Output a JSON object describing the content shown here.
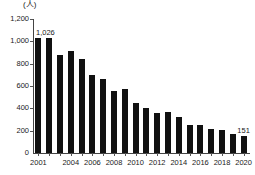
{
  "chart_data": {
    "type": "bar",
    "title": "",
    "subtitle": "",
    "unit_label": "(人)",
    "xlabel": "",
    "ylabel": "",
    "ylim": [
      0,
      1200
    ],
    "ytick_values": [
      0,
      200,
      400,
      600,
      800,
      1000,
      1200
    ],
    "ytick_labels": [
      "0",
      "200",
      "400",
      "600",
      "800",
      "1,000",
      "1,200"
    ],
    "grid": false,
    "legend": "none",
    "bar_color": "#111111",
    "categories": [
      "2001",
      "2002",
      "2003",
      "2004",
      "2005",
      "2006",
      "2007",
      "2008",
      "2009",
      "2010",
      "2011",
      "2012",
      "2013",
      "2014",
      "2015",
      "2016",
      "2017",
      "2018",
      "2019",
      "2020"
    ],
    "xtick_labels_shown": [
      "2001",
      "2004",
      "2006",
      "2008",
      "2010",
      "2012",
      "2014",
      "2016",
      "2018",
      "2020"
    ],
    "values": [
      1026,
      1030,
      880,
      915,
      840,
      700,
      665,
      555,
      575,
      450,
      405,
      360,
      365,
      320,
      255,
      250,
      215,
      210,
      170,
      151
    ],
    "annotations": [
      {
        "category": "2001",
        "text": "1,026",
        "value": 1026
      },
      {
        "category": "2020",
        "text": "151",
        "value": 151
      }
    ]
  }
}
